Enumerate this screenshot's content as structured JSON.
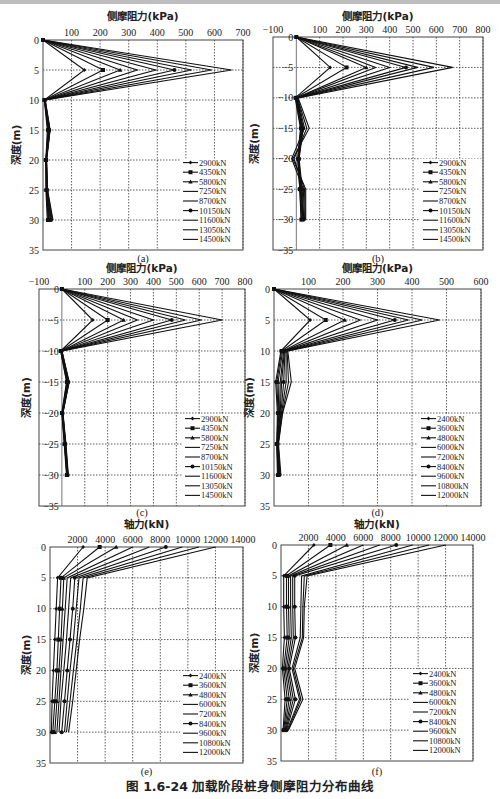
{
  "figure": {
    "caption": "图 1.6-24   加载阶段桩身侧摩阻力分布曲线"
  },
  "chart_data": [
    {
      "panel": "(a)",
      "type": "line",
      "title": "侧摩阻力(kPa)",
      "xlabel": "侧摩阻力(kPa)",
      "ylabel": "深度(m)",
      "xlim": [
        0,
        700
      ],
      "xticks": [
        100,
        200,
        300,
        400,
        500,
        600,
        700
      ],
      "ylim": [
        0,
        35
      ],
      "yticks": [
        0,
        5,
        10,
        15,
        20,
        25,
        30,
        35
      ],
      "y_inverted": true,
      "grid": true,
      "legend_position": "lower right",
      "depths": [
        0,
        5,
        10,
        15,
        20,
        25,
        30
      ],
      "series": [
        {
          "name": "2900kN",
          "marker": "diamond",
          "values": [
            0,
            145,
            5,
            15,
            10,
            10,
            15
          ]
        },
        {
          "name": "4350kN",
          "marker": "square",
          "values": [
            0,
            210,
            5,
            18,
            10,
            12,
            18
          ]
        },
        {
          "name": "5800kN",
          "marker": "triangle",
          "values": [
            0,
            270,
            5,
            20,
            10,
            12,
            20
          ]
        },
        {
          "name": "7250kN",
          "marker": "dash",
          "values": [
            0,
            330,
            6,
            20,
            11,
            13,
            22
          ]
        },
        {
          "name": "8700kN",
          "marker": "dash",
          "values": [
            0,
            395,
            6,
            22,
            11,
            14,
            25
          ]
        },
        {
          "name": "10150kN",
          "marker": "circle",
          "values": [
            0,
            460,
            6,
            22,
            12,
            14,
            28
          ]
        },
        {
          "name": "11600kN",
          "marker": "none",
          "values": [
            0,
            520,
            7,
            24,
            12,
            15,
            30
          ]
        },
        {
          "name": "13050kN",
          "marker": "none",
          "values": [
            0,
            590,
            7,
            24,
            12,
            15,
            33
          ]
        },
        {
          "name": "14500kN",
          "marker": "none",
          "values": [
            0,
            660,
            8,
            25,
            13,
            16,
            35
          ]
        }
      ]
    },
    {
      "panel": "(b)",
      "type": "line",
      "title": "侧摩阻力(kPa)",
      "xlabel": "侧摩阻力(kPa)",
      "ylabel": "深度(m)",
      "xlim": [
        -100,
        800
      ],
      "xticks": [
        -100,
        100,
        200,
        300,
        400,
        500,
        600,
        700,
        800
      ],
      "ylim": [
        0,
        35
      ],
      "yticks": [
        0,
        5,
        10,
        15,
        20,
        25,
        30,
        35
      ],
      "y_inverted": true,
      "grid": true,
      "legend_position": "lower right",
      "depths": [
        0,
        5,
        10,
        15,
        20,
        25,
        30
      ],
      "series": [
        {
          "name": "2900kN",
          "marker": "diamond",
          "values": [
            0,
            145,
            -5,
            18,
            5,
            15,
            20
          ]
        },
        {
          "name": "4350kN",
          "marker": "square",
          "values": [
            0,
            215,
            -3,
            20,
            8,
            15,
            22
          ]
        },
        {
          "name": "5800kN",
          "marker": "triangle",
          "values": [
            0,
            300,
            0,
            22,
            10,
            18,
            25
          ]
        },
        {
          "name": "7250kN",
          "marker": "dash",
          "values": [
            0,
            340,
            0,
            25,
            10,
            20,
            28
          ]
        },
        {
          "name": "8700kN",
          "marker": "dash",
          "values": [
            0,
            400,
            2,
            28,
            10,
            22,
            30
          ]
        },
        {
          "name": "10150kN",
          "marker": "circle",
          "values": [
            0,
            470,
            3,
            30,
            12,
            25,
            32
          ]
        },
        {
          "name": "11600kN",
          "marker": "none",
          "values": [
            0,
            520,
            5,
            35,
            -20,
            30,
            35
          ]
        },
        {
          "name": "13050kN",
          "marker": "none",
          "values": [
            0,
            590,
            5,
            45,
            -10,
            35,
            38
          ]
        },
        {
          "name": "14500kN",
          "marker": "none",
          "values": [
            0,
            670,
            8,
            55,
            -15,
            40,
            40
          ]
        }
      ]
    },
    {
      "panel": "(c)",
      "type": "line",
      "title": "侧摩阻力(kPa)",
      "xlabel": "侧摩阻力(kPa)",
      "ylabel": "深度(m)",
      "xlim": [
        -100,
        800
      ],
      "xticks": [
        -100,
        100,
        200,
        300,
        400,
        500,
        600,
        700,
        800
      ],
      "ylim": [
        0,
        35
      ],
      "yticks": [
        0,
        5,
        10,
        15,
        20,
        25,
        30,
        35
      ],
      "y_inverted": true,
      "grid": true,
      "legend_position": "lower right",
      "depths": [
        0,
        5,
        10,
        15,
        20,
        25,
        30
      ],
      "series": [
        {
          "name": "2900kN",
          "marker": "diamond",
          "values": [
            0,
            135,
            -5,
            20,
            0,
            10,
            20
          ]
        },
        {
          "name": "4350kN",
          "marker": "square",
          "values": [
            0,
            200,
            -5,
            22,
            0,
            12,
            22
          ]
        },
        {
          "name": "5800kN",
          "marker": "triangle",
          "values": [
            0,
            270,
            -3,
            25,
            2,
            12,
            22
          ]
        },
        {
          "name": "7250kN",
          "marker": "dash",
          "values": [
            0,
            330,
            -3,
            25,
            2,
            14,
            24
          ]
        },
        {
          "name": "8700kN",
          "marker": "dash",
          "values": [
            0,
            400,
            -2,
            28,
            3,
            15,
            25
          ]
        },
        {
          "name": "10150kN",
          "marker": "circle",
          "values": [
            0,
            480,
            -2,
            28,
            3,
            15,
            25
          ]
        },
        {
          "name": "11600kN",
          "marker": "none",
          "values": [
            0,
            540,
            0,
            30,
            4,
            16,
            26
          ]
        },
        {
          "name": "13050kN",
          "marker": "none",
          "values": [
            0,
            610,
            0,
            30,
            4,
            16,
            27
          ]
        },
        {
          "name": "14500kN",
          "marker": "none",
          "values": [
            0,
            700,
            0,
            32,
            5,
            18,
            28
          ]
        }
      ]
    },
    {
      "panel": "(d)",
      "type": "line",
      "title": "侧摩阻力(kPa)",
      "xlabel": "侧摩阻力(kPa)",
      "ylabel": "深度(m)",
      "xlim": [
        0,
        600
      ],
      "xticks": [
        100,
        200,
        300,
        400,
        500,
        600
      ],
      "ylim": [
        0,
        35
      ],
      "yticks": [
        0,
        5,
        10,
        15,
        20,
        25,
        30,
        35
      ],
      "y_inverted": true,
      "grid": true,
      "legend_position": "lower right",
      "depths": [
        0,
        5,
        10,
        15,
        20,
        25,
        30
      ],
      "series": [
        {
          "name": "2400kN",
          "marker": "diamond",
          "values": [
            0,
            105,
            20,
            5,
            10,
            8,
            10
          ]
        },
        {
          "name": "3600kN",
          "marker": "square",
          "values": [
            0,
            150,
            22,
            8,
            12,
            8,
            12
          ]
        },
        {
          "name": "4800kN",
          "marker": "triangle",
          "values": [
            0,
            205,
            25,
            12,
            14,
            9,
            12
          ]
        },
        {
          "name": "6000kN",
          "marker": "dash",
          "values": [
            0,
            250,
            28,
            18,
            16,
            10,
            14
          ]
        },
        {
          "name": "7200kN",
          "marker": "dash",
          "values": [
            0,
            300,
            30,
            22,
            18,
            10,
            15
          ]
        },
        {
          "name": "8400kN",
          "marker": "circle",
          "values": [
            0,
            350,
            32,
            28,
            20,
            11,
            16
          ]
        },
        {
          "name": "9600kN",
          "marker": "none",
          "values": [
            0,
            390,
            35,
            35,
            22,
            12,
            17
          ]
        },
        {
          "name": "10800kN",
          "marker": "none",
          "values": [
            0,
            430,
            38,
            42,
            24,
            12,
            18
          ]
        },
        {
          "name": "12000kN",
          "marker": "none",
          "values": [
            0,
            480,
            40,
            50,
            25,
            13,
            20
          ]
        }
      ]
    },
    {
      "panel": "(e)",
      "type": "line",
      "title": "轴力(kN)",
      "xlabel": "轴力(kN)",
      "ylabel": "深度(m)",
      "xlim": [
        0,
        14000
      ],
      "xticks": [
        2000,
        4000,
        6000,
        8000,
        10000,
        12000,
        14000
      ],
      "ylim": [
        0,
        35
      ],
      "yticks": [
        0,
        5,
        10,
        15,
        20,
        25,
        30,
        35
      ],
      "y_inverted": true,
      "grid": true,
      "legend_position": "lower right",
      "depths": [
        0,
        5,
        10,
        15,
        20,
        25,
        30
      ],
      "series": [
        {
          "name": "2400kN",
          "marker": "diamond",
          "values": [
            2400,
            550,
            450,
            350,
            250,
            150,
            100
          ]
        },
        {
          "name": "3600kN",
          "marker": "square",
          "values": [
            3600,
            800,
            700,
            600,
            500,
            350,
            200
          ]
        },
        {
          "name": "4800kN",
          "marker": "triangle",
          "values": [
            4800,
            1000,
            900,
            800,
            650,
            500,
            350
          ]
        },
        {
          "name": "6000kN",
          "marker": "dash",
          "values": [
            6000,
            1250,
            1100,
            950,
            800,
            650,
            500
          ]
        },
        {
          "name": "7200kN",
          "marker": "dash",
          "values": [
            7200,
            1500,
            1350,
            1200,
            1000,
            800,
            650
          ]
        },
        {
          "name": "8400kN",
          "marker": "circle",
          "values": [
            8400,
            1800,
            1650,
            1450,
            1250,
            1050,
            850
          ]
        },
        {
          "name": "9600kN",
          "marker": "none",
          "values": [
            9600,
            2100,
            1900,
            1700,
            1450,
            1250,
            1050
          ]
        },
        {
          "name": "10800kN",
          "marker": "none",
          "values": [
            10800,
            2400,
            2200,
            1950,
            1700,
            1450,
            1200
          ]
        },
        {
          "name": "12000kN",
          "marker": "none",
          "values": [
            12000,
            2700,
            2450,
            2150,
            1900,
            1650,
            1350
          ]
        }
      ]
    },
    {
      "panel": "(f)",
      "type": "line",
      "title": "轴力(kN)",
      "xlabel": "轴力(kN)",
      "ylabel": "深度(m)",
      "xlim": [
        0,
        14000
      ],
      "xticks": [
        2000,
        4000,
        6000,
        8000,
        10000,
        12000,
        14000
      ],
      "ylim": [
        0,
        35
      ],
      "yticks": [
        0,
        5,
        10,
        15,
        20,
        25,
        30,
        35
      ],
      "y_inverted": true,
      "grid": true,
      "legend_position": "lower right",
      "depths": [
        0,
        5,
        10,
        15,
        20,
        25,
        30
      ],
      "series": [
        {
          "name": "2400kN",
          "marker": "diamond",
          "values": [
            2400,
            200,
            200,
            250,
            100,
            300,
            150
          ]
        },
        {
          "name": "3600kN",
          "marker": "square",
          "values": [
            3600,
            400,
            400,
            450,
            200,
            450,
            200
          ]
        },
        {
          "name": "4800kN",
          "marker": "triangle",
          "values": [
            4800,
            550,
            550,
            600,
            300,
            600,
            250
          ]
        },
        {
          "name": "6000kN",
          "marker": "dash",
          "values": [
            6000,
            700,
            700,
            750,
            400,
            750,
            300
          ]
        },
        {
          "name": "7200kN",
          "marker": "dash",
          "values": [
            7200,
            850,
            850,
            900,
            500,
            900,
            350
          ]
        },
        {
          "name": "8400kN",
          "marker": "circle",
          "values": [
            8400,
            1000,
            1000,
            1050,
            600,
            1050,
            400
          ]
        },
        {
          "name": "9600kN",
          "marker": "none",
          "values": [
            9600,
            1500,
            1450,
            1400,
            800,
            1350,
            450
          ]
        },
        {
          "name": "10800kN",
          "marker": "none",
          "values": [
            10800,
            1700,
            1600,
            1550,
            900,
            1450,
            500
          ]
        },
        {
          "name": "12000kN",
          "marker": "none",
          "values": [
            12000,
            1900,
            1700,
            1650,
            1000,
            1600,
            550
          ]
        }
      ]
    }
  ]
}
